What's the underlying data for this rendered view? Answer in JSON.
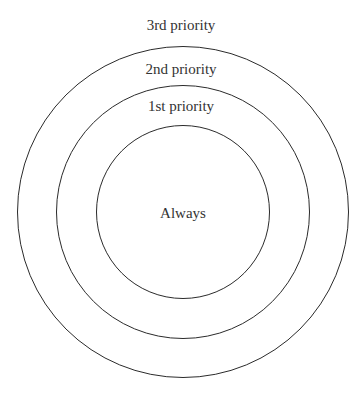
{
  "diagram": {
    "type": "concentric-circles",
    "center": {
      "x": 183,
      "y": 212
    },
    "line_color": "#2b2b2b",
    "text_color": "#333333",
    "rings": [
      {
        "label": "3rd priority",
        "radius": 166,
        "label_y": 16
      },
      {
        "label": "2nd priority",
        "radius": 127,
        "label_y": 60
      },
      {
        "label": "1st priority",
        "radius": 87,
        "label_y": 97
      }
    ],
    "center_label": "Always"
  }
}
